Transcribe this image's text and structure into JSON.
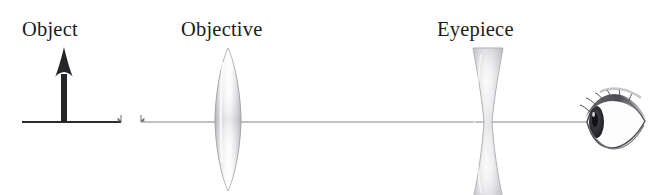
{
  "diagram": {
    "background_color": "#ffffff",
    "axis": {
      "name": "optical-axis",
      "color_dark": "#2b2b2f",
      "color_light": "#86868c",
      "y": 122,
      "left_segment": {
        "x1": 22,
        "x2": 121
      },
      "right_segment": {
        "x1": 141,
        "x2": 588
      },
      "break_markers": [
        {
          "x": 123,
          "direction": "right"
        },
        {
          "x": 139,
          "direction": "left"
        }
      ]
    },
    "labels": [
      {
        "id": "object-label",
        "text": "Object",
        "x": 22,
        "y": 36
      },
      {
        "id": "objective-label",
        "text": "Objective",
        "x": 181,
        "y": 36
      },
      {
        "id": "eyepiece-label",
        "text": "Eyepiece",
        "x": 437,
        "y": 36
      }
    ],
    "object_arrow": {
      "name": "object-arrow",
      "color": "#26262a",
      "x": 64,
      "base_y": 122,
      "tip_y": 48,
      "shaft_width": 6,
      "head_width": 17,
      "head_height": 30
    },
    "lenses": [
      {
        "id": "objective-lens",
        "label": "Objective",
        "type": "biconvex",
        "center_x": 228,
        "top_y": 48,
        "bottom_y": 191,
        "half_width": 13,
        "fill_light": "#fbfbfb",
        "fill_mid": "#d9d9dc",
        "fill_shadow": "#a8a8ad",
        "stroke": "#9a9a9f"
      },
      {
        "id": "eyepiece-lens",
        "label": "Eyepiece",
        "type": "biconcave",
        "center_x": 488,
        "top_y": 48,
        "bottom_y": 199,
        "edge_half_width": 15,
        "waist_half_width": 4,
        "fill_light": "#fcfcfc",
        "fill_mid": "#dddde0",
        "fill_shadow": "#b4b4b9",
        "stroke": "#a6a6ab"
      }
    ],
    "eye": {
      "name": "observer-eye",
      "center_x": 614,
      "center_y": 122,
      "width": 60,
      "height": 54,
      "outline_color": "#4a4a50",
      "iris_color": "#2e2e34",
      "lash_color": "#5c5c62",
      "sclera_color": "#fdfdfd"
    }
  }
}
